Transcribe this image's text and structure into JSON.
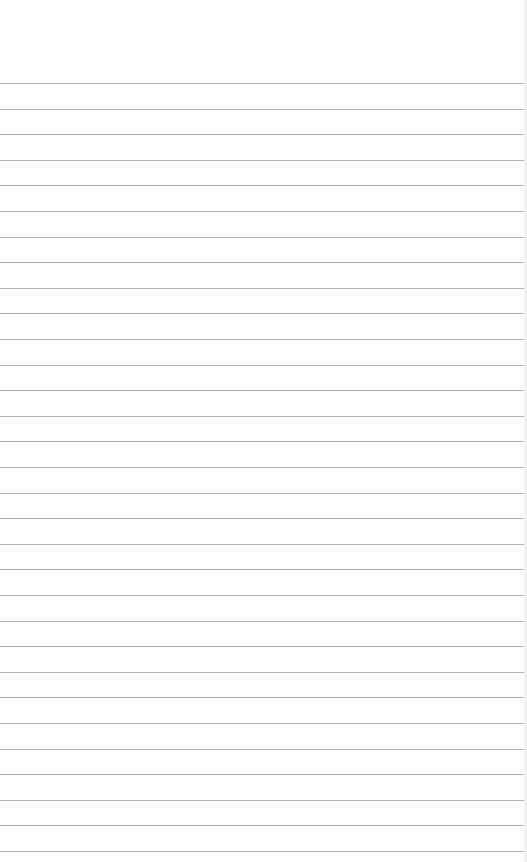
{
  "page": {
    "type": "lined-paper",
    "background_color": "#fefefe",
    "line_color": "#b4b4b4",
    "line_count": 31,
    "first_line_y": 83,
    "line_spacing": 25.6,
    "content_text": ""
  }
}
